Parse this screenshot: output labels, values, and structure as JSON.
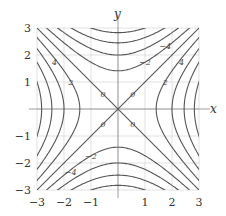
{
  "chart_data": {
    "type": "contour",
    "title": "",
    "xlabel": "x",
    "ylabel": "y",
    "xlim": [
      -3,
      3
    ],
    "ylim": [
      -3,
      3
    ],
    "grid": true,
    "x_ticks": [
      "-3",
      "-2",
      "-1",
      "1",
      "2",
      "3"
    ],
    "y_ticks": [
      "3",
      "2",
      "1",
      "-1",
      "-2",
      "-3"
    ],
    "contour_levels": [
      -8,
      -6,
      -4,
      -2,
      0,
      2,
      4,
      6,
      8
    ],
    "contour_labels": [
      {
        "text": "-4",
        "x": 1.75,
        "y": 2.35
      },
      {
        "text": "-2",
        "x": 1.0,
        "y": 1.75
      },
      {
        "text": "0",
        "x": -0.55,
        "y": 0.55
      },
      {
        "text": "0",
        "x": 0.55,
        "y": 0.55
      },
      {
        "text": "0",
        "x": -0.55,
        "y": -0.55
      },
      {
        "text": "0",
        "x": 0.55,
        "y": -0.55
      },
      {
        "text": "2",
        "x": 1.75,
        "y": 1.0
      },
      {
        "text": "4",
        "x": 2.35,
        "y": 1.75
      },
      {
        "text": "4",
        "x": -2.35,
        "y": 1.75
      },
      {
        "text": "2",
        "x": -1.75,
        "y": 1.0
      },
      {
        "text": "-2",
        "x": -1.0,
        "y": -1.75
      },
      {
        "text": "-4",
        "x": -1.75,
        "y": -2.35
      }
    ],
    "note": "Curves drawn as level sets of y^2 - x^2 = c; this form is an approximation matching the visible saddle shape and labels, not a formula shown in the image."
  },
  "axes": {
    "x_label": "x",
    "y_label": "y"
  },
  "colors": {
    "contour": "#555555",
    "grid": "#cccccc",
    "axis": "#888888"
  }
}
